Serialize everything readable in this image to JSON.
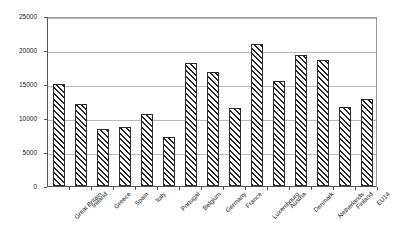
{
  "chart_data": {
    "type": "bar",
    "title": "",
    "subtitle": "",
    "xlabel": "",
    "ylabel": "",
    "ylim": [
      0,
      25000
    ],
    "ytick_interval": 5000,
    "yticks": [
      "0",
      "5000",
      "10000",
      "15000",
      "20000",
      "25000"
    ],
    "ytick_values": [
      0,
      5000,
      10000,
      15000,
      20000,
      25000
    ],
    "grid": true,
    "grid_axis": "y",
    "legend": false,
    "legend_position": "none",
    "bar_fill": "diagonal-hatch",
    "bar_edge_color": "#2b2b2b",
    "bar_face_color": "#ffffff",
    "categories": [
      "Great Britain",
      "Ireland",
      "Greece",
      "Spain",
      "Italy",
      "Portugal",
      "Belgium",
      "Germany",
      "France",
      "Luxembourg",
      "Austria",
      "Denmark",
      "Netherlands",
      "Finland",
      "EU14"
    ],
    "values": [
      15000,
      12000,
      8400,
      8700,
      10600,
      7200,
      18100,
      16700,
      11400,
      20900,
      15400,
      19300,
      18500,
      11600,
      12800
    ],
    "series": [
      {
        "name": "",
        "values": [
          15000,
          12000,
          8400,
          8700,
          10600,
          7200,
          18100,
          16700,
          11400,
          20900,
          15400,
          19300,
          18500,
          11600,
          12800
        ]
      }
    ]
  }
}
